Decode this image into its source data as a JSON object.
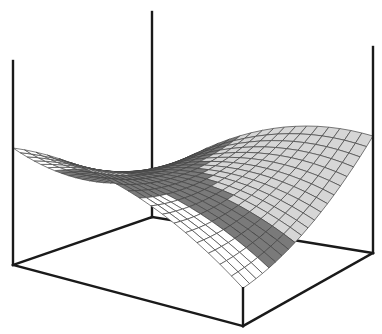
{
  "figure": {
    "title": "Saddle surface in bounding box",
    "grid_divisions": 20,
    "colors": {
      "background": "#ffffff",
      "box_edge": "#1a1a1a",
      "mesh_line": "#444444",
      "region_dark": "#7a7a7a",
      "region_light": "#d6d6d6",
      "region_white": "#ffffff"
    },
    "box": {
      "back_bottom": [
        152,
        217
      ],
      "left_bottom": [
        13,
        265
      ],
      "right_bottom": [
        373,
        253
      ],
      "front_bottom": [
        243,
        326
      ],
      "back_top": [
        152,
        12
      ],
      "left_top": [
        13,
        61
      ],
      "right_top": [
        373,
        47
      ]
    }
  }
}
